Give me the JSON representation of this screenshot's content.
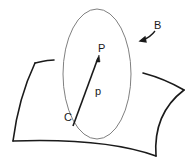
{
  "diagram": {
    "labels": {
      "body": "B",
      "point": "P",
      "position_vector": "p",
      "origin": "C"
    },
    "colors": {
      "ink": "#1a1a1a",
      "ellipse": "#808080",
      "background": "#ffffff"
    }
  }
}
